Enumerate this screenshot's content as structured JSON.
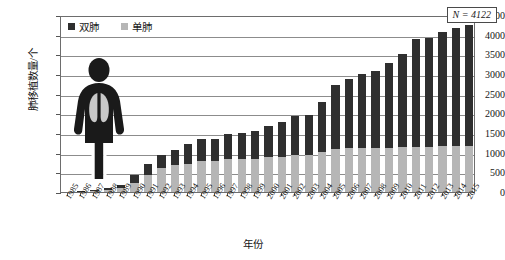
{
  "chart_data": {
    "type": "bar",
    "stacked": true,
    "title": "",
    "xlabel": "年份",
    "ylabel": "肺移植数量/个",
    "ylim": [
      0,
      4500
    ],
    "ytick_step": 500,
    "yticks": [
      0,
      500,
      1000,
      1500,
      2000,
      2500,
      3000,
      3500,
      4000,
      4500
    ],
    "grid": true,
    "legend_position": "top-left",
    "annotation": "N = 4122",
    "categories": [
      "1985",
      "1986",
      "1987",
      "1988",
      "1989",
      "1990",
      "1991",
      "1992",
      "1993",
      "1994",
      "1995",
      "1996",
      "1997",
      "1998",
      "1999",
      "2000",
      "2001",
      "2002",
      "2003",
      "2004",
      "2005",
      "2006",
      "2007",
      "2008",
      "2009",
      "2010",
      "2011",
      "2012",
      "2013",
      "2014",
      "2015"
    ],
    "series": [
      {
        "name": "单肺",
        "color": "#b6b6b6",
        "values": [
          5,
          10,
          20,
          40,
          95,
          240,
          430,
          600,
          680,
          720,
          780,
          790,
          830,
          840,
          850,
          880,
          900,
          930,
          950,
          1010,
          1090,
          1110,
          1120,
          1120,
          1130,
          1140,
          1150,
          1150,
          1160,
          1160,
          1170
        ]
      },
      {
        "name": "双肺",
        "color": "#2f2f2f",
        "values": [
          5,
          10,
          30,
          50,
          90,
          180,
          270,
          330,
          400,
          490,
          560,
          570,
          650,
          660,
          690,
          810,
          880,
          990,
          1010,
          1290,
          1620,
          1770,
          1880,
          1960,
          2160,
          2370,
          2740,
          2760,
          2910,
          3000,
          3070
        ]
      }
    ],
    "totals": [
      10,
      20,
      50,
      90,
      185,
      420,
      700,
      930,
      1080,
      1210,
      1340,
      1360,
      1480,
      1500,
      1540,
      1690,
      1780,
      1920,
      1960,
      2300,
      2710,
      2880,
      3000,
      3080,
      3290,
      3510,
      3890,
      3910,
      4070,
      4160,
      4240
    ]
  },
  "legend": {
    "items": [
      {
        "label": "双肺",
        "color": "#2f2f2f"
      },
      {
        "label": "单肺",
        "color": "#b6b6b6"
      }
    ]
  },
  "pictogram": {
    "name": "human-lungs-figure"
  }
}
